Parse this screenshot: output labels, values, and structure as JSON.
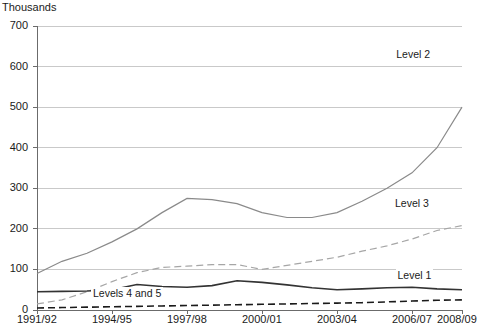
{
  "chart_data": {
    "type": "line",
    "title": "",
    "subtitle": "",
    "unit_label": "Thousands",
    "xlabel": "",
    "ylabel": "",
    "ylim": [
      0,
      700
    ],
    "yticks": [
      0,
      100,
      200,
      300,
      400,
      500,
      600,
      700
    ],
    "grid": true,
    "legend_position": "inline-right",
    "x": [
      "1991/92",
      "1992/93",
      "1993/94",
      "1994/95",
      "1995/96",
      "1996/97",
      "1997/98",
      "1998/99",
      "1999/00",
      "2000/01",
      "2001/02",
      "2002/03",
      "2003/04",
      "2004/05",
      "2005/06",
      "2006/07",
      "2007/08",
      "2008/09"
    ],
    "xtick_labels": [
      "1991/92",
      "1994/95",
      "1997/98",
      "2000/01",
      "2003/04",
      "2006/07",
      "2008/09"
    ],
    "xtick_positions": [
      0,
      3,
      6,
      9,
      12,
      15,
      17
    ],
    "series": [
      {
        "name": "Level 2",
        "style": "solid",
        "color": "#8a8a8a",
        "label_x": 15.05,
        "label_y": 628,
        "values": [
          90,
          120,
          140,
          168,
          200,
          240,
          275,
          272,
          262,
          240,
          228,
          228,
          240,
          268,
          300,
          338,
          400,
          500
        ]
      },
      {
        "name": "Level 3",
        "style": "dashed",
        "color": "#a6a6a6",
        "label_x": 15.0,
        "label_y": 262,
        "values": [
          15,
          25,
          45,
          70,
          92,
          105,
          108,
          112,
          112,
          100,
          110,
          120,
          130,
          145,
          158,
          175,
          196,
          208
        ]
      },
      {
        "name": "Level 1",
        "style": "solid",
        "color": "#333333",
        "label_x": 15.1,
        "label_y": 85,
        "values": [
          45,
          46,
          47,
          50,
          63,
          58,
          56,
          60,
          72,
          68,
          62,
          55,
          50,
          52,
          55,
          56,
          52,
          50
        ]
      },
      {
        "name": "Levels 4 and 5",
        "style": "dashed",
        "color": "#1a1a1a",
        "label_x": 3.6,
        "label_y": 40,
        "values": [
          5,
          6,
          7,
          8,
          9,
          10,
          11,
          12,
          13,
          14,
          15,
          16,
          17,
          18,
          20,
          22,
          24,
          25
        ]
      }
    ],
    "series_end_note": {
      "Level 2": 640
    }
  }
}
